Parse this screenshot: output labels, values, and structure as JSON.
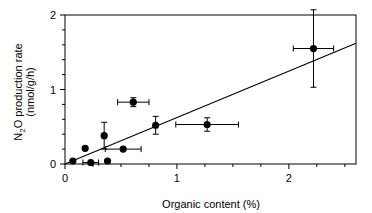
{
  "chart_data": {
    "type": "scatter",
    "title": "",
    "xlabel": "Organic content (%)",
    "ylabel": "N2O production rate (nmol/g/h)",
    "ylabel_line1": "N2O production rate",
    "ylabel_line2": "(nmol/g/h)",
    "ylabel_prefix": "N",
    "ylabel_sub": "2",
    "ylabel_suffix": "O production rate",
    "xlim": [
      0,
      2.6
    ],
    "ylim": [
      0,
      2.0
    ],
    "x_major_ticks": [
      0,
      1,
      2
    ],
    "x_major_tick_labels": [
      "0",
      "1",
      "2"
    ],
    "x_minor_tick_step": 0.25,
    "y_major_ticks": [
      0,
      1,
      2
    ],
    "y_major_tick_labels": [
      "0",
      "1",
      "2"
    ],
    "y_minor_tick_step": 0.2,
    "grid": false,
    "legend": "none",
    "frame": "box",
    "marker": "filled-circle",
    "points": [
      {
        "x": 0.07,
        "y": 0.04,
        "xerr": 0.0,
        "yerr": 0.0
      },
      {
        "x": 0.18,
        "y": 0.21,
        "xerr": 0.0,
        "yerr": 0.0
      },
      {
        "x": 0.23,
        "y": 0.02,
        "xerr": 0.07,
        "yerr": 0.0
      },
      {
        "x": 0.35,
        "y": 0.38,
        "xerr": 0.0,
        "yerr": 0.18
      },
      {
        "x": 0.38,
        "y": 0.04,
        "xerr": 0.0,
        "yerr": 0.0
      },
      {
        "x": 0.52,
        "y": 0.2,
        "xerr": 0.16,
        "yerr": 0.0
      },
      {
        "x": 0.61,
        "y": 0.83,
        "xerr": 0.14,
        "yerr": 0.06
      },
      {
        "x": 0.81,
        "y": 0.52,
        "xerr": 0.0,
        "yerr": 0.12
      },
      {
        "x": 1.27,
        "y": 0.53,
        "xerr": 0.28,
        "yerr": 0.09
      },
      {
        "x": 2.22,
        "y": 1.55,
        "xerr": 0.18,
        "yerr": 0.52
      }
    ],
    "trendline": {
      "type": "line",
      "x_start": 0.0,
      "y_start": 0.0,
      "x_end": 2.6,
      "y_end": 1.62,
      "slope": 0.623,
      "intercept": 0.0
    },
    "colors": {
      "marker": "#000000",
      "line": "#000000",
      "axis": "#000000",
      "background": "#ffffff"
    }
  }
}
